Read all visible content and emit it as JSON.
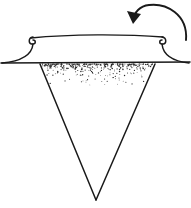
{
  "figure": {
    "background_color": "#ffffff",
    "ink_color": "#1a1a1a",
    "stipple_color": "#2b2b2b",
    "width": 191,
    "height": 208,
    "style": "black-and-white line drawing"
  },
  "parts": {
    "rotation_arrow": {
      "name": "rotation-arrow",
      "description": "curved semicircular arrow indicating clockwise rotation, arrowhead at lower-left",
      "path": "M 186 40 C 188 14, 166 3, 149 5 C 140 6, 134 12, 133 21",
      "arrowhead": "M 133 24 L 127 11 L 141 14 Z",
      "stroke_width": 1.9
    },
    "rim_top_edge": {
      "name": "rim-top-edge",
      "description": "upper horizontal edge of the collar, slightly bowed",
      "path": "M 31 38 C 70 34, 125 34, 163 37",
      "stroke_width": 1.4
    },
    "rim_left_curl": {
      "name": "rim-left-curl",
      "description": "small hook curl at the left top of the collar",
      "path": "M 33 37 C 28 38, 28 44, 33 44 C 36 44, 36 40, 33 40",
      "stroke_width": 1.5
    },
    "rim_right_curl": {
      "name": "rim-right-curl",
      "description": "small hook curl at the right top of the collar",
      "path": "M 162 37 C 167 38, 167 44, 162 44 C 159 44, 159 40, 162 40",
      "stroke_width": 1.5
    },
    "flare_left": {
      "name": "flare-left-wall",
      "description": "left outward-flaring wall sweeping from collar down to the base line",
      "path": "M 33 44 C 32 54, 24 61, 2 63",
      "stroke_width": 1.5
    },
    "flare_right": {
      "name": "flare-right-wall",
      "description": "right outward-flaring wall sweeping from collar down to the base line",
      "path": "M 162 44 C 163 54, 171 61, 189 63",
      "stroke_width": 1.5
    },
    "base_line": {
      "name": "base-horizontal-line",
      "description": "long horizontal line across the full width marking the funnel mouth",
      "path": "M 1 63 L 190 62",
      "stroke_width": 1.6
    },
    "cone_left": {
      "name": "cone-left-edge",
      "description": "left slanted edge of the downward conical funnel",
      "path": "M 40 64 L 96 200",
      "stroke_width": 1.5
    },
    "cone_right": {
      "name": "cone-right-edge",
      "description": "right slanted edge of the downward conical funnel",
      "path": "M 155 64 L 96 200",
      "stroke_width": 1.5
    },
    "stipple_region": {
      "name": "stipple-granular-fill",
      "description": "dense-to-sparse dot stippling just below the base line representing granular material",
      "top": 64,
      "bottom": 88,
      "left_at_top": 41,
      "right_at_top": 154,
      "apex_x": 96,
      "apex_y": 200,
      "dot_count": 330,
      "dot_radius_min": 0.35,
      "dot_radius_max": 0.85
    }
  }
}
